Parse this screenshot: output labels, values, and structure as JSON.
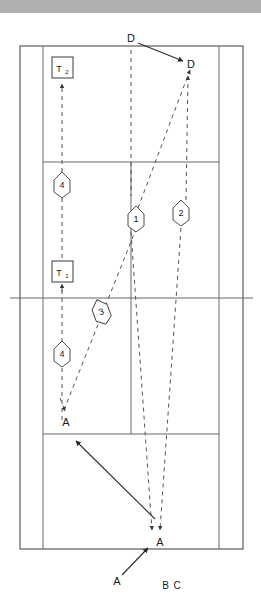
{
  "page": {
    "width": 261,
    "height": 604,
    "background": "#ffffff",
    "top_bar_color": "#b0b0b0"
  },
  "diagram": {
    "type": "court-play-diagram",
    "court": {
      "doubles_left_x": 20,
      "singles_left_x": 43,
      "singles_right_x": 219,
      "doubles_right_x": 243,
      "baseline_top_y": 46,
      "service_line_top_y": 162,
      "net_y": 298,
      "service_line_bottom_y": 434,
      "baseline_bottom_y": 549,
      "center_x": 131
    },
    "line_color": "#666666",
    "outline_color": "#4d4d4d",
    "trajectory_color": "#555555",
    "arrow_color": "#2b2b2b"
  },
  "labels": {
    "point_d_origin": "D",
    "point_d_target": "D",
    "point_a_upper": "A",
    "point_a_mid": "A",
    "point_a_lower": "A",
    "bottom_legend": "B C"
  },
  "markers": [
    {
      "id": "marker-1",
      "label": "1",
      "shape": "pentagon",
      "x": 136,
      "y": 218,
      "rotation": 0
    },
    {
      "id": "marker-2",
      "label": "2",
      "shape": "pentagon",
      "x": 181,
      "y": 212,
      "rotation": 0
    },
    {
      "id": "marker-3",
      "label": "3",
      "shape": "pentagon",
      "x": 101,
      "y": 311,
      "rotation": -20
    },
    {
      "id": "marker-4-upper",
      "label": "4",
      "shape": "pentagon",
      "x": 62,
      "y": 184,
      "rotation": 0
    },
    {
      "id": "marker-4-lower",
      "label": "4",
      "shape": "pentagon",
      "x": 62,
      "y": 353,
      "rotation": 0
    }
  ],
  "team_boxes": [
    {
      "id": "box-t2",
      "label": "T",
      "subscript": "2",
      "x": 62,
      "y": 68
    },
    {
      "id": "box-t1",
      "label": "T",
      "subscript": "1",
      "x": 62,
      "y": 272
    }
  ]
}
